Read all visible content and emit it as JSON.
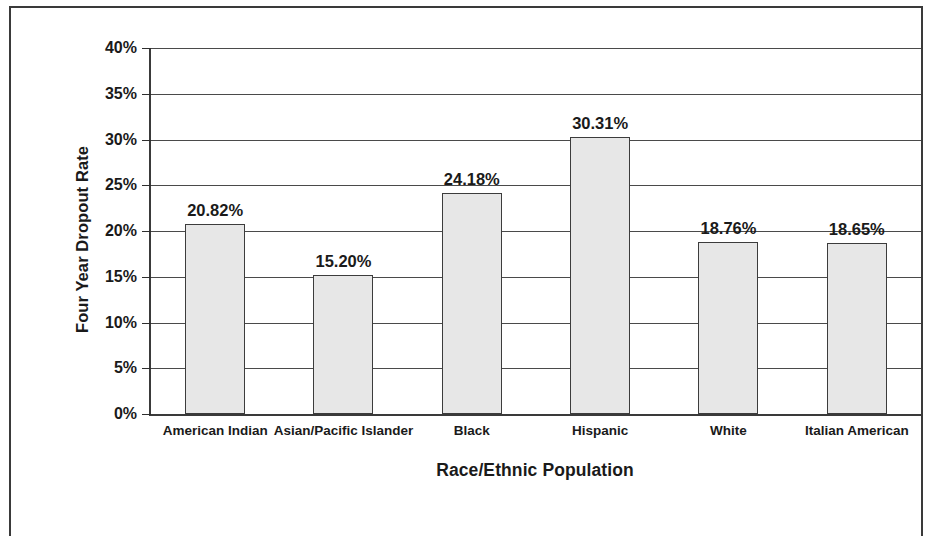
{
  "chart_data": {
    "type": "bar",
    "title": "",
    "xlabel": "Race/Ethnic Population",
    "ylabel": "Four Year Dropout Rate",
    "categories": [
      "American Indian",
      "Asian/Pacific Islander",
      "Black",
      "Hispanic",
      "White",
      "Italian American"
    ],
    "values": [
      20.82,
      15.2,
      24.18,
      30.31,
      18.76,
      18.65
    ],
    "value_labels": [
      "20.82%",
      "15.20%",
      "24.18%",
      "30.31%",
      "18.76%",
      "18.65%"
    ],
    "ylim": [
      0,
      40
    ],
    "ytick_values": [
      0,
      5,
      10,
      15,
      20,
      25,
      30,
      35,
      40
    ],
    "ytick_labels": [
      "0%",
      "5%",
      "10%",
      "15%",
      "20%",
      "25%",
      "30%",
      "35%",
      "40%"
    ],
    "grid": true,
    "grid_axis": "y",
    "legend": false,
    "legend_position": "none",
    "bar_fill_color": "#e7e7e7",
    "bar_edge_color": "#3c3c3c",
    "gridline_color": "#4a4a4a",
    "axis_color": "#3a3a3a",
    "background_color": "#ffffff"
  }
}
